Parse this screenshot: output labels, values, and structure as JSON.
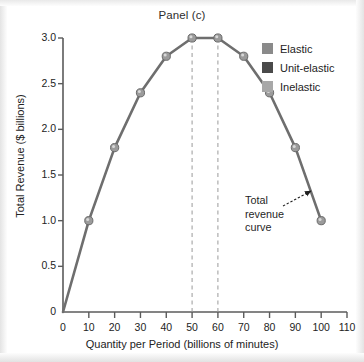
{
  "figure": {
    "title": "Panel (c)"
  },
  "legend": {
    "items": [
      {
        "label": "Elastic",
        "color": "#8a8a8a"
      },
      {
        "label": "Unit-elastic",
        "color": "#4a4a4a"
      },
      {
        "label": "Inelastic",
        "color": "#a8a8a8"
      }
    ]
  },
  "annotation": {
    "line1": "Total",
    "line2": "revenue",
    "line3": "curve"
  },
  "chart_data": {
    "type": "line",
    "title": "Panel (c)",
    "xlabel": "Quantity per Period (billions of minutes)",
    "ylabel": "Total Revenue ($ billions)",
    "xlim": [
      0,
      110
    ],
    "ylim": [
      0,
      3.0
    ],
    "grid": false,
    "legend_position": "upper-right",
    "xticks": [
      0,
      10,
      20,
      30,
      40,
      50,
      60,
      70,
      80,
      90,
      100,
      110
    ],
    "xtick_labels": [
      "0",
      "10",
      "20",
      "30",
      "40",
      "50",
      "60",
      "70",
      "80",
      "90",
      "100",
      "110"
    ],
    "yticks": [
      0,
      0.5,
      1.0,
      1.5,
      2.0,
      2.5,
      3.0
    ],
    "ytick_labels": [
      "0",
      "0.5",
      "1.0",
      "1.5",
      "2.0",
      "2.5",
      "3.0"
    ],
    "series": [
      {
        "name": "Total revenue curve",
        "color": "#6e6e6e",
        "marker": "circle",
        "x": [
          0,
          10,
          20,
          30,
          40,
          50,
          60,
          70,
          80,
          90,
          100
        ],
        "values": [
          0,
          1.0,
          1.8,
          2.4,
          2.8,
          3.0,
          3.0,
          2.8,
          2.4,
          1.8,
          1.0
        ]
      }
    ],
    "markers_start_index": 1,
    "reference_lines": [
      {
        "type": "vline",
        "x": 50,
        "style": "dashed",
        "color": "#9a9a9a",
        "y_top": 3.0
      },
      {
        "type": "vline",
        "x": 60,
        "style": "dashed",
        "color": "#9a9a9a",
        "y_top": 3.0
      }
    ],
    "annotations": [
      {
        "text": "Total revenue curve",
        "text_x": 82,
        "text_y": 1.45,
        "arrow_to_x": 97,
        "arrow_to_y": 1.35
      }
    ]
  }
}
